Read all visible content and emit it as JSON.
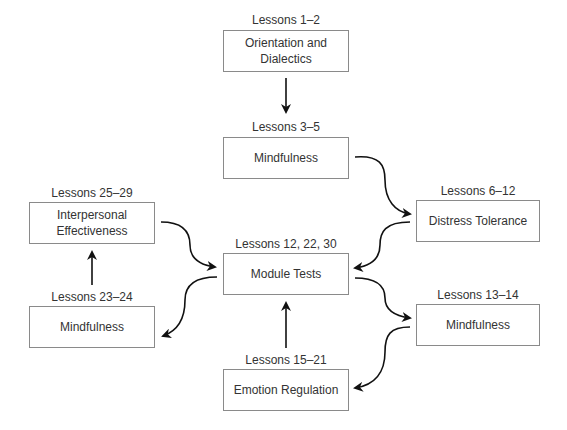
{
  "diagram": {
    "nodes": [
      {
        "id": "orientation",
        "lessons": "Lessons 1–2",
        "title": "Orientation and\nDialectics",
        "title_lines": [
          "Orientation and",
          "Dialectics"
        ]
      },
      {
        "id": "mindfulness-1",
        "lessons": "Lessons 3–5",
        "title": "Mindfulness"
      },
      {
        "id": "distress",
        "lessons": "Lessons 6–12",
        "title": "Distress Tolerance"
      },
      {
        "id": "interpersonal",
        "lessons": "Lessons 25–29",
        "title_lines": [
          "Interpersonal",
          "Effectiveness"
        ]
      },
      {
        "id": "module-tests",
        "lessons": "Lessons 12, 22, 30",
        "title": "Module Tests"
      },
      {
        "id": "mindfulness-3",
        "lessons": "Lessons 23–24",
        "title": "Mindfulness"
      },
      {
        "id": "mindfulness-2",
        "lessons": "Lessons 13–14",
        "title": "Mindfulness"
      },
      {
        "id": "emotion",
        "lessons": "Lessons 15–21",
        "title": "Emotion Regulation"
      }
    ],
    "edges": [
      {
        "from": "orientation",
        "to": "mindfulness-1"
      },
      {
        "from": "mindfulness-1",
        "to": "distress"
      },
      {
        "from": "distress",
        "to": "module-tests"
      },
      {
        "from": "module-tests",
        "to": "mindfulness-2"
      },
      {
        "from": "mindfulness-2",
        "to": "emotion"
      },
      {
        "from": "emotion",
        "to": "module-tests"
      },
      {
        "from": "module-tests",
        "to": "mindfulness-3"
      },
      {
        "from": "mindfulness-3",
        "to": "interpersonal"
      },
      {
        "from": "interpersonal",
        "to": "module-tests"
      }
    ]
  }
}
